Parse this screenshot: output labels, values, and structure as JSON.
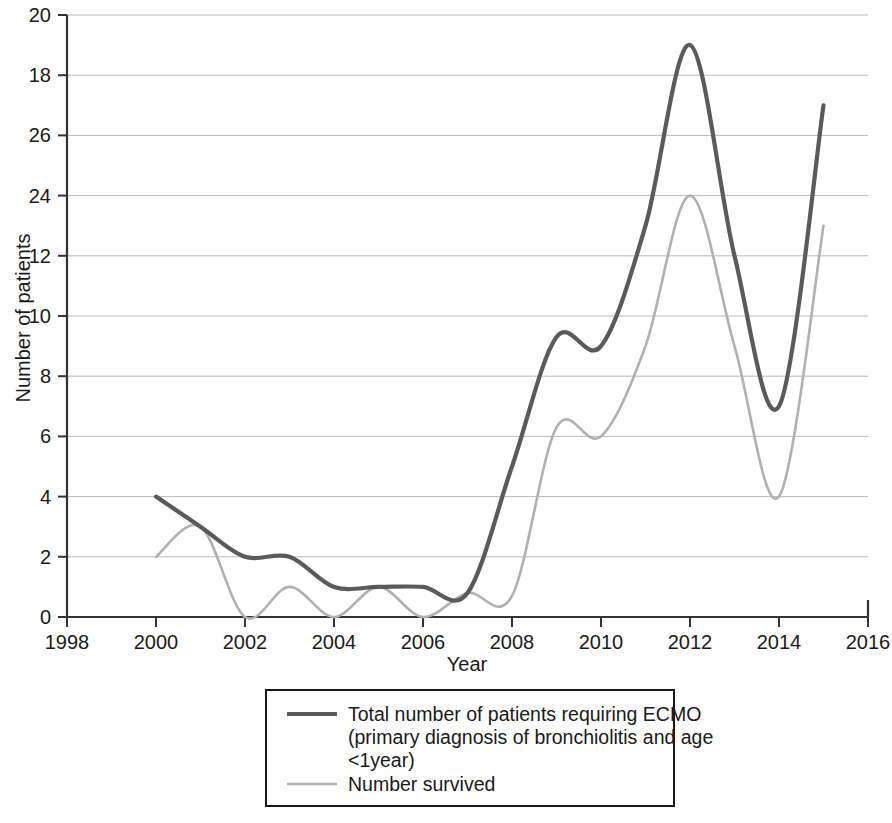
{
  "chart_data": {
    "type": "line",
    "title": "",
    "xlabel": "Year",
    "ylabel": "Number of patients",
    "xlim": [
      1998,
      2016
    ],
    "ylim": [
      0,
      20
    ],
    "grid": true,
    "legend_position": "bottom-center",
    "x_tick_labels": [
      "1998",
      "2000",
      "2002",
      "2004",
      "2006",
      "2008",
      "2010",
      "2012",
      "2014",
      "2016"
    ],
    "x_ticks": [
      1998,
      2000,
      2002,
      2004,
      2006,
      2008,
      2010,
      2012,
      2014,
      2016
    ],
    "y_tick_labels": [
      "0",
      "2",
      "4",
      "6",
      "8",
      "10",
      "12",
      "24",
      "26",
      "18",
      "20"
    ],
    "y_ticks": [
      0,
      2,
      4,
      6,
      8,
      10,
      12,
      14,
      16,
      18,
      20
    ],
    "x": [
      2000,
      2001,
      2002,
      2003,
      2004,
      2005,
      2006,
      2007,
      2008,
      2009,
      2010,
      2011,
      2012,
      2013,
      2014,
      2015
    ],
    "series": [
      {
        "name": "Total number of patients requiring ECMO (primary diagnosis of bronchiolitis and age <1year)",
        "color": "#5a5a5a",
        "values": [
          4,
          3,
          2,
          2,
          1,
          1,
          1,
          0.8,
          5,
          9.3,
          9,
          13,
          19,
          12,
          7,
          17
        ]
      },
      {
        "name": "Number survived",
        "color": "#b0b0b0",
        "values": [
          2,
          3,
          0,
          1,
          0,
          1,
          0,
          0.8,
          0.7,
          6.3,
          6,
          9,
          14,
          9,
          4,
          13
        ]
      }
    ]
  },
  "axes": {
    "y_title": "Number of patients",
    "x_title": "Year"
  },
  "legend": {
    "entries": [
      {
        "swatch": "line-swatch-dark",
        "lines": [
          "Total number of patients requiring ECMO",
          "(primary diagnosis of bronchiolitis and age",
          "<1year)"
        ]
      },
      {
        "swatch": "line-swatch-light",
        "lines": [
          "Number survived"
        ]
      }
    ]
  }
}
